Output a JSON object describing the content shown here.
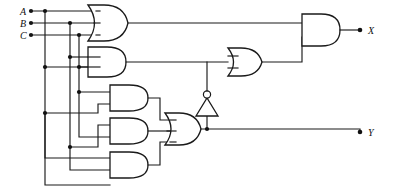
{
  "diagram": {
    "type": "logic-circuit-schematic",
    "width": 393,
    "height": 192,
    "background_color": "#ffffff",
    "line_color": "#1a1a1a"
  },
  "inputs": [
    {
      "id": "A",
      "label": "A",
      "x": 20,
      "y": 11
    },
    {
      "id": "B",
      "label": "B",
      "x": 20,
      "y": 23
    },
    {
      "id": "C",
      "label": "C",
      "x": 20,
      "y": 35
    }
  ],
  "outputs": [
    {
      "id": "X",
      "label": "X",
      "x": 370,
      "y": 30
    },
    {
      "id": "Y",
      "label": "Y",
      "x": 370,
      "y": 132
    }
  ],
  "gates": [
    {
      "id": "G1",
      "type": "OR",
      "inputs": 3,
      "label": "or-gate-top",
      "x": 88,
      "y": 5,
      "w": 40,
      "h": 36
    },
    {
      "id": "G2",
      "type": "AND",
      "inputs": 3,
      "label": "and-gate-second",
      "x": 88,
      "y": 47,
      "w": 38,
      "h": 30
    },
    {
      "id": "G3",
      "type": "AND",
      "inputs": 2,
      "label": "and-gate-third",
      "x": 110,
      "y": 85,
      "w": 38,
      "h": 26
    },
    {
      "id": "G4",
      "type": "AND",
      "inputs": 2,
      "label": "and-gate-fourth",
      "x": 110,
      "y": 118,
      "w": 38,
      "h": 26
    },
    {
      "id": "G5",
      "type": "AND",
      "inputs": 2,
      "label": "and-gate-fifth",
      "x": 110,
      "y": 152,
      "w": 38,
      "h": 26
    },
    {
      "id": "G6",
      "type": "OR",
      "inputs": 3,
      "label": "or-gate-lower",
      "x": 165,
      "y": 113,
      "w": 36,
      "h": 32
    },
    {
      "id": "G7",
      "type": "NOT",
      "inputs": 1,
      "label": "inverter",
      "x": 196,
      "y": 92,
      "w": 22,
      "h": 24,
      "orientation": "up"
    },
    {
      "id": "G8",
      "type": "OR",
      "inputs": 2,
      "label": "or-gate-right",
      "x": 228,
      "y": 48,
      "w": 34,
      "h": 28
    },
    {
      "id": "G9",
      "type": "AND",
      "inputs": 2,
      "label": "and-gate-output",
      "x": 302,
      "y": 14,
      "w": 38,
      "h": 32
    }
  ],
  "nets": [
    {
      "from": "A",
      "to": "G1.in1"
    },
    {
      "from": "B",
      "to": "G1.in2"
    },
    {
      "from": "C",
      "to": "G1.in3"
    },
    {
      "from": "G1.out",
      "to": "G9.in1"
    },
    {
      "from": "G2.out",
      "to": "G8.in1"
    },
    {
      "from": "G6.out",
      "to": "G7.in"
    },
    {
      "from": "G7.out",
      "to": "G8.in2"
    },
    {
      "from": "G8.out",
      "to": "G9.in2"
    },
    {
      "from": "G9.out",
      "to": "X"
    },
    {
      "from": "G6.out",
      "to": "Y"
    },
    {
      "from": "G3.out",
      "to": "G6.in1"
    },
    {
      "from": "G4.out",
      "to": "G6.in2"
    },
    {
      "from": "G5.out",
      "to": "G6.in3"
    }
  ],
  "junction_dots": [
    {
      "x": 45,
      "y": 11
    },
    {
      "x": 70,
      "y": 23
    },
    {
      "x": 79,
      "y": 35
    },
    {
      "x": 70,
      "y": 57
    },
    {
      "x": 45,
      "y": 67
    },
    {
      "x": 79,
      "y": 67
    },
    {
      "x": 79,
      "y": 92
    },
    {
      "x": 45,
      "y": 113
    },
    {
      "x": 70,
      "y": 147
    }
  ],
  "input_terminals": [
    {
      "x": 31,
      "y": 11
    },
    {
      "x": 31,
      "y": 23
    },
    {
      "x": 31,
      "y": 35
    }
  ],
  "output_terminals": [
    {
      "x": 360,
      "y": 30
    },
    {
      "x": 360,
      "y": 132
    }
  ]
}
